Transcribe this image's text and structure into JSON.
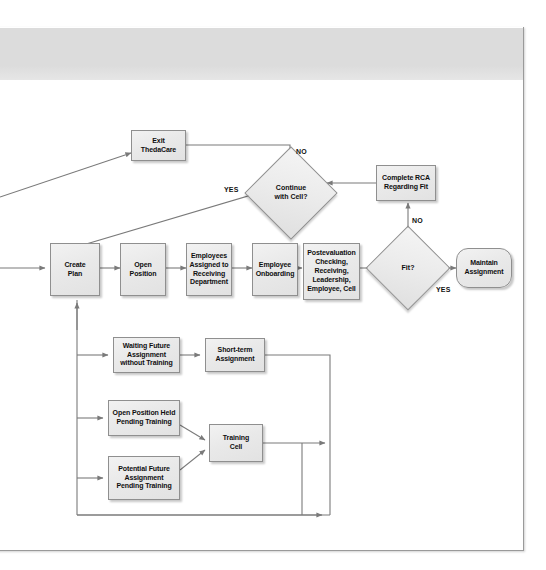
{
  "document": {
    "type": "process-flow-diagram",
    "header_band_color": "#dcdcdc",
    "page_background": "#ffffff"
  },
  "theme": {
    "node_fill": "#eaeaea",
    "node_border": "#8f8f8f",
    "edge_color": "#7a7a7a",
    "text_color": "#0f0f0f"
  },
  "nodes": {
    "exit_thedacare": "Exit\nThedaCare",
    "continue_with_cell": "Continue\nwith Cell?",
    "complete_rca": "Complete RCA\nRegarding Fit",
    "create_plan": "Create\nPlan",
    "open_position": "Open\nPosition",
    "employees_assigned": "Employees\nAssigned to\nReceiving\nDepartment",
    "employee_onboarding": "Employee\nOnboarding",
    "postevaluation": "Postevaluation\nChecking,\nReceiving,\nLeadership,\nEmployee, Cell",
    "fit": "Fit?",
    "maintain_assignment": "Maintain\nAssignment",
    "waiting_future": "Waiting Future\nAssignment\nwithout Training",
    "short_term": "Short-term\nAssignment",
    "open_position_held": "Open Position Held\nPending Training",
    "potential_future": "Potential Future\nAssignment\nPending Training",
    "training_cell": "Training\nCell"
  },
  "edge_labels": {
    "continue_no": "NO",
    "continue_yes": "YES",
    "fit_no": "NO",
    "fit_yes": "YES"
  }
}
